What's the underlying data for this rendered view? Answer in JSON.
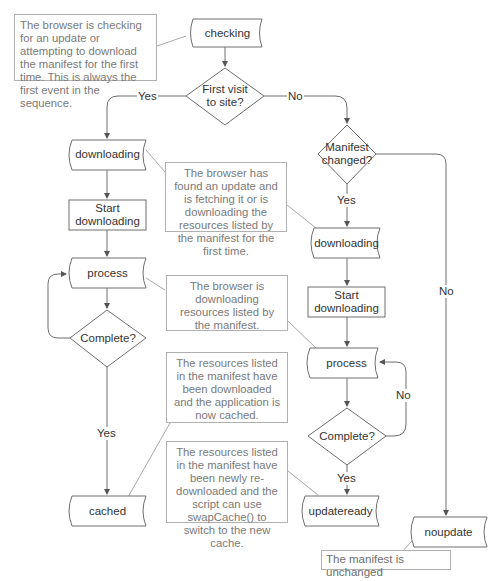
{
  "diagram": {
    "type": "flowchart",
    "nodes": {
      "checking": "checking",
      "first_visit": "First visit to site?",
      "first_visit_l1": "First visit",
      "first_visit_l2": "to site?",
      "downloading_left": "downloading",
      "start_downloading_left_l1": "Start",
      "start_downloading_left_l2": "downloading",
      "process_left": "process",
      "complete_left": "Complete?",
      "cached": "cached",
      "manifest_changed_l1": "Manifest",
      "manifest_changed_l2": "changed?",
      "downloading_right": "downloading",
      "start_downloading_right_l1": "Start",
      "start_downloading_right_l2": "downloading",
      "process_right": "process",
      "complete_right": "Complete?",
      "updateready": "updateready",
      "noupdate": "noupdate"
    },
    "edges": {
      "first_visit_yes": "Yes",
      "first_visit_no": "No",
      "manifest_changed_yes": "Yes",
      "manifest_changed_no": "No",
      "complete_left_yes": "Yes",
      "complete_right_no": "No",
      "complete_right_yes": "Yes"
    },
    "notes": {
      "checking": "The browser is checking for an update or attempting to download the manifest for the first time. This is always the first event in the sequence.",
      "downloading": "The browser has found an update and is fetching it or is downloading the resources listed by the manifest for the first time.",
      "progress": "The browser is downloading resources listed by the manifest.",
      "cached": "The resources listed in the manifest have been downloaded and the application is now cached.",
      "updateready": "The resources listed in the manifest have been newly re-downloaded and the script can use swapCache() to switch to the new cache.",
      "noupdate": "The manifest is unchanged"
    },
    "colors": {
      "shape_stroke": "#6e6e6e",
      "note_border": "#b0b0b0",
      "note_text": "#7a7a7a",
      "label_text": "#333333"
    }
  }
}
